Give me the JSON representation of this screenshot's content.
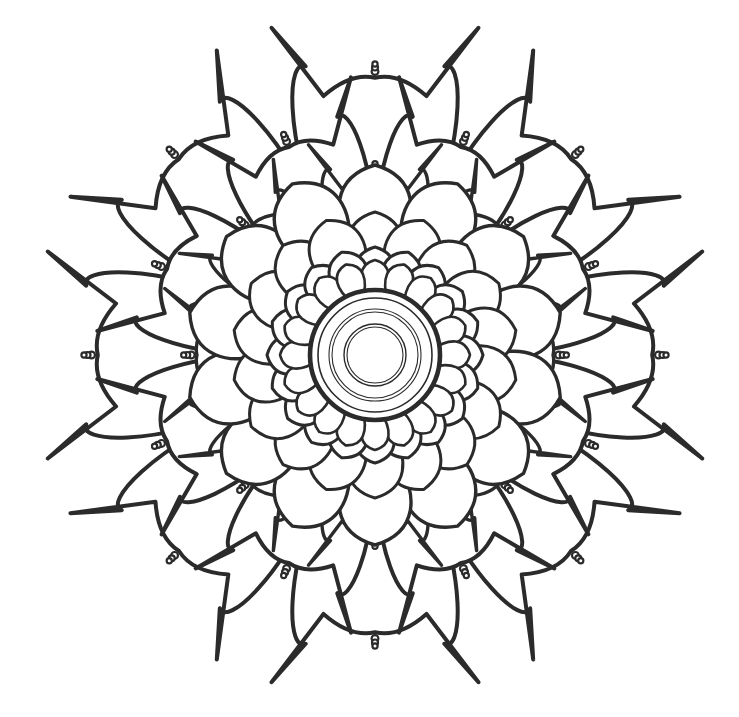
{
  "artwork": {
    "title": "Floral Mandala Coloring Page",
    "type": "line-art",
    "style": "black and white outline coloring page",
    "subject": "radially symmetric flower mandala"
  },
  "canvas": {
    "width": 739,
    "height": 717,
    "background_color": "#ffffff",
    "center_x": 375,
    "center_y": 355
  },
  "colors": {
    "background": "#ffffff",
    "outline": "#2b2b2b",
    "fill": "#ffffff"
  },
  "stroke_widths": {
    "bold_outer": 4.0,
    "petal_heavy": 3.4,
    "petal_medium": 3.0,
    "petal_light": 2.6,
    "center_bold": 4.6,
    "center_thin": 1.1,
    "bead": 2.2
  },
  "layers": [
    {
      "name": "outer-lobe-ring",
      "order": 1,
      "count": 8,
      "description": "outermost broad rounded lobes each with curved horn spikes and a beaded finial at apex",
      "lobe_radius_outer": 330,
      "lobe_width_deg": 45,
      "start_angle_deg": -90,
      "has_spikes": true,
      "has_finial": true
    },
    {
      "name": "mid-lobe-ring",
      "order": 2,
      "count": 8,
      "description": "second tier broad lobes offset by half step, with horn spikes and beaded finials",
      "lobe_radius_outer": 268,
      "lobe_width_deg": 45,
      "start_angle_deg": -67.5,
      "has_spikes": true,
      "has_finial": true
    },
    {
      "name": "inner-lobe-ring",
      "order": 3,
      "count": 8,
      "description": "third tier lobes tucked behind the petal rosette, with horn spikes and beaded finials",
      "lobe_radius_outer": 212,
      "lobe_width_deg": 45,
      "start_angle_deg": -90,
      "has_spikes": true,
      "has_finial": true
    },
    {
      "name": "petal-ring-4",
      "order": 4,
      "count": 14,
      "description": "large round petals forming the outer rosette",
      "petal_center_radius": 150,
      "petal_radius": 40
    },
    {
      "name": "petal-ring-3",
      "order": 5,
      "count": 18,
      "description": "round petals, second rosette tier",
      "petal_center_radius": 112,
      "petal_radius": 31
    },
    {
      "name": "petal-ring-2",
      "order": 6,
      "count": 20,
      "description": "teardrop petals, third rosette tier",
      "petal_center_radius": 85,
      "petal_radius": 23
    },
    {
      "name": "petal-ring-1",
      "order": 7,
      "count": 20,
      "description": "innermost small teardrop petals ringing the medallion",
      "petal_center_radius": 79,
      "petal_radius": 16
    }
  ],
  "center_medallion": {
    "name": "center-medallion",
    "description": "bold outer circle enclosing four thin concentric rings",
    "rings": [
      {
        "radius": 65,
        "stroke_width": 4.6,
        "label": "outer-bold-ring"
      },
      {
        "radius": 57,
        "stroke_width": 1.6,
        "label": "ring-2"
      },
      {
        "radius": 46,
        "stroke_width": 1.1,
        "label": "ring-3"
      },
      {
        "radius": 43,
        "stroke_width": 1.1,
        "label": "ring-4"
      },
      {
        "radius": 31,
        "stroke_width": 1.4,
        "label": "ring-5"
      },
      {
        "radius": 28,
        "stroke_width": 1.1,
        "label": "inner-core-ring"
      }
    ]
  },
  "finial": {
    "name": "beaded-finial",
    "description": "small stacked beads forming a knob at each spike apex",
    "bead_count": 3,
    "bead_radii": [
      3.4,
      3.0,
      2.6
    ]
  }
}
